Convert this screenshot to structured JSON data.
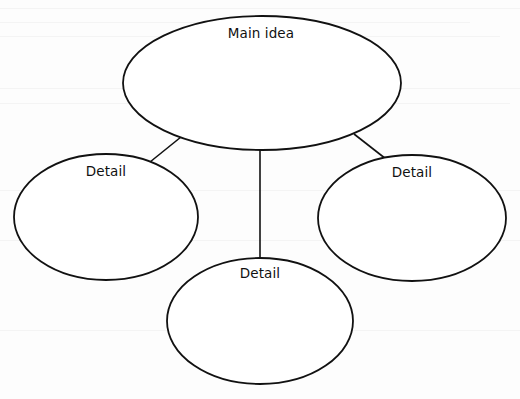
{
  "diagram": {
    "type": "idea-web",
    "colors": {
      "stroke": "#111111",
      "fill": "#ffffff",
      "text": "#111111",
      "background": "#fdfdfd"
    },
    "nodes": [
      {
        "id": "main",
        "label": "Main idea",
        "cx": 262,
        "cy": 83,
        "rx": 139,
        "ry": 67,
        "label_x": 261,
        "label_y": 25
      },
      {
        "id": "detail-left",
        "label": "Detail",
        "cx": 106,
        "cy": 217,
        "rx": 92,
        "ry": 63,
        "label_x": 106,
        "label_y": 163
      },
      {
        "id": "detail-right",
        "label": "Detail",
        "cx": 412,
        "cy": 218,
        "rx": 94,
        "ry": 63,
        "label_x": 412,
        "label_y": 164
      },
      {
        "id": "detail-bottom",
        "label": "Detail",
        "cx": 260,
        "cy": 321,
        "rx": 93,
        "ry": 63,
        "label_x": 260,
        "label_y": 265
      }
    ],
    "edges": [
      {
        "from": "main",
        "to": "detail-left",
        "x1": 181,
        "y1": 137,
        "x2": 150,
        "y2": 162
      },
      {
        "from": "main",
        "to": "detail-bottom",
        "x1": 260,
        "y1": 150,
        "x2": 260,
        "y2": 258
      },
      {
        "from": "main",
        "to": "detail-right",
        "x1": 354,
        "y1": 134,
        "x2": 386,
        "y2": 159
      }
    ]
  }
}
